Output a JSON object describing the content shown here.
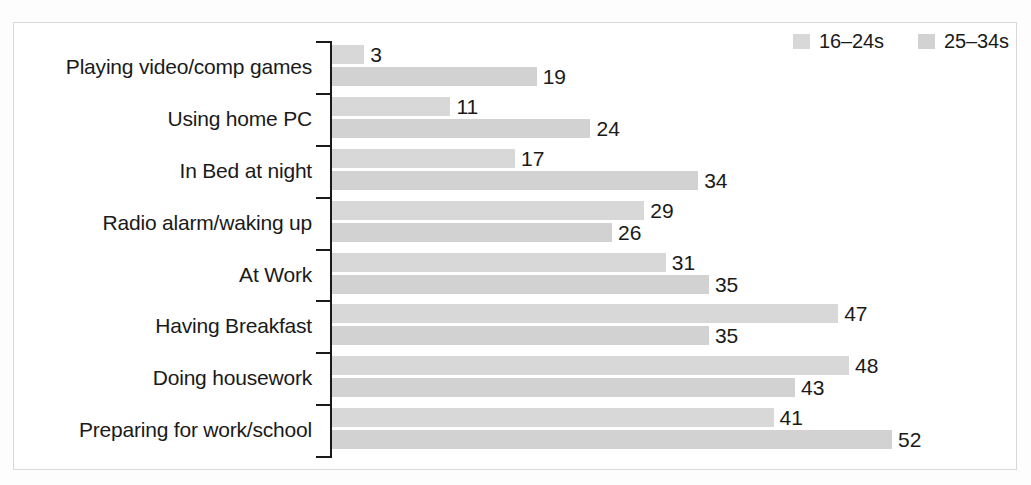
{
  "figure": {
    "frame_border_color": "#d9d9d9",
    "background": "#ffffff"
  },
  "legend": {
    "position": "top-right",
    "items": [
      {
        "label": "16–24s",
        "color": "#d8d8d8",
        "swatch_name": "legend-swatch-16-24s"
      },
      {
        "label": "25–34s",
        "color": "#d2d2d2",
        "swatch_name": "legend-swatch-25-34s"
      }
    ]
  },
  "chart_data": {
    "type": "bar",
    "orientation": "horizontal",
    "title": "",
    "subtitle": "",
    "xlabel": "",
    "ylabel": "",
    "xlim": [
      0,
      56
    ],
    "grid": false,
    "legend_position": "top-right",
    "bar_label_position": "outside-end",
    "categories": [
      "Playing video/comp games",
      "Using home PC",
      "In Bed at night",
      "Radio alarm/waking up",
      "At Work",
      "Having Breakfast",
      "Doing housework",
      "Preparing for work/school"
    ],
    "series": [
      {
        "name": "16–24s",
        "color": "#d8d8d8",
        "values": [
          3,
          11,
          17,
          29,
          31,
          47,
          48,
          41
        ]
      },
      {
        "name": "25–34s",
        "color": "#d2d2d2",
        "values": [
          19,
          24,
          34,
          26,
          35,
          35,
          43,
          52
        ]
      }
    ]
  },
  "scale": {
    "px_per_unit": 10.77,
    "axis_x_px": 330
  }
}
